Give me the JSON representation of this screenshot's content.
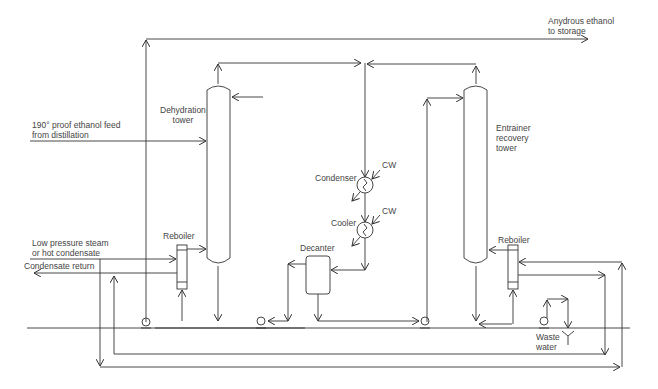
{
  "diagram": {
    "colors": {
      "line": "#333333",
      "text": "#444444",
      "background": "#ffffff"
    },
    "labels": {
      "product": "Anydrous ethanol\nto storage",
      "feed": "190° proof ethanol feed\nfrom distillation",
      "dehydration_tower": "Dehydration\ntower",
      "entrainer_tower": "Entrainer\nrecovery\ntower",
      "condenser": "Condenser",
      "cw_condenser": "CW",
      "cooler": "Cooler",
      "cw_cooler": "CW",
      "decanter": "Decanter",
      "reboiler_left": "Reboiler",
      "reboiler_right": "Reboiler",
      "steam": "Low pressure steam\nor hot condensate",
      "condensate_return": "Condensate return",
      "waste_water": "Waste\nwater"
    },
    "equipment": [
      {
        "id": "dehydration-tower",
        "type": "column"
      },
      {
        "id": "entrainer-recovery-tower",
        "type": "column"
      },
      {
        "id": "condenser",
        "type": "heat-exchanger"
      },
      {
        "id": "cooler",
        "type": "heat-exchanger"
      },
      {
        "id": "decanter",
        "type": "vessel"
      },
      {
        "id": "reboiler-left",
        "type": "reboiler"
      },
      {
        "id": "reboiler-right",
        "type": "reboiler"
      },
      {
        "id": "pump-1",
        "type": "pump"
      },
      {
        "id": "pump-2",
        "type": "pump"
      },
      {
        "id": "pump-3",
        "type": "pump"
      },
      {
        "id": "pump-4",
        "type": "pump"
      }
    ]
  }
}
